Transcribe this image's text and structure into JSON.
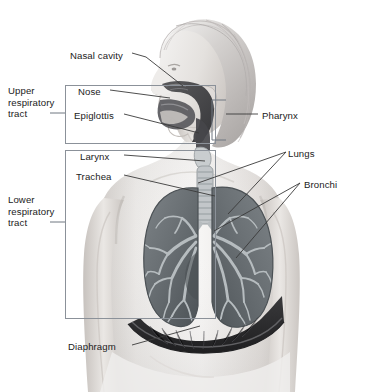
{
  "figure": {
    "view": "anterior torso with right lateral head profile, cutaway lungs",
    "style": "grayscale medical illustration"
  },
  "colors": {
    "background": "#ffffff",
    "label_text": "#1b1b1b",
    "leader_line": "#3a3a3a",
    "bracket_line": "#6f7680",
    "skin_light": "#f2f0ee",
    "skin_mid": "#ddd9d6",
    "skin_shadow": "#bfbab6",
    "hair_light": "#e8e6e4",
    "hair_mid": "#c9c6c4",
    "hair_dark": "#a9a5a3",
    "airway_dark": "#4a4a4c",
    "airway_darker": "#3a3a3c",
    "lung_fill": "#6e7478",
    "lung_fill_dark": "#575d61",
    "bronchi_tree": "#b9bfc2",
    "trachea_ring": "#c4c8ca",
    "diaphragm_dark": "#2b2b2d"
  },
  "group_labels": [
    {
      "id": "upper-respiratory-tract",
      "text": "Upper\nrespiratory\ntract",
      "x": 8,
      "y": 85,
      "tick": {
        "x1": 50,
        "y1": 113,
        "x2": 65,
        "y2": 113
      }
    },
    {
      "id": "lower-respiratory-tract",
      "text": "Lower\nrespiratory\ntract",
      "x": 8,
      "y": 194,
      "tick": {
        "x1": 50,
        "y1": 222,
        "x2": 65,
        "y2": 222
      }
    }
  ],
  "boxes": [
    {
      "id": "upper-tract-box",
      "x": 65,
      "y": 85,
      "w": 150,
      "h": 58
    },
    {
      "id": "lower-tract-box",
      "x": 65,
      "y": 150,
      "w": 150,
      "h": 168
    }
  ],
  "part_labels": [
    {
      "id": "nasal-cavity",
      "text": "Nasal cavity",
      "x": 70,
      "y": 56,
      "anchor": "start"
    },
    {
      "id": "nose",
      "text": "Nose",
      "x": 78,
      "y": 93,
      "anchor": "start"
    },
    {
      "id": "epiglottis",
      "text": "Epiglottis",
      "x": 74,
      "y": 117,
      "anchor": "start"
    },
    {
      "id": "pharynx",
      "text": "Pharynx",
      "x": 262,
      "y": 117,
      "anchor": "start"
    },
    {
      "id": "larynx",
      "text": "Larynx",
      "x": 80,
      "y": 158,
      "anchor": "start"
    },
    {
      "id": "trachea",
      "text": "Trachea",
      "x": 76,
      "y": 178,
      "anchor": "start"
    },
    {
      "id": "lungs",
      "text": "Lungs",
      "x": 288,
      "y": 155,
      "anchor": "start"
    },
    {
      "id": "bronchi",
      "text": "Bronchi",
      "x": 304,
      "y": 186,
      "anchor": "start"
    },
    {
      "id": "diaphragm",
      "text": "Diaphragm",
      "x": 68,
      "y": 348,
      "anchor": "start"
    }
  ],
  "leader_lines": [
    {
      "for": "nasal-cavity",
      "points": "132,53 146,57 183,86"
    },
    {
      "for": "nose",
      "points": "110,90 170,98"
    },
    {
      "for": "epiglottis",
      "points": "124,114 199,133"
    },
    {
      "for": "pharynx",
      "points": "258,114 226,114"
    },
    {
      "for": "larynx",
      "points": "124,155 205,161"
    },
    {
      "for": "trachea",
      "points": "124,175 215,196"
    },
    {
      "for": "lungs-a",
      "points": "286,152 198,183"
    },
    {
      "for": "lungs-b",
      "points": "286,152 228,214"
    },
    {
      "for": "bronchi-a",
      "points": "300,183 214,231"
    },
    {
      "for": "bronchi-b",
      "points": "300,183 236,258"
    },
    {
      "for": "diaphragm",
      "points": "132,345 200,326"
    }
  ],
  "brackets": [
    {
      "id": "pharynx-bracket",
      "x": 212,
      "y": 100,
      "w": 14,
      "h": 40,
      "open_side": "right"
    }
  ],
  "anatomy_parts": [
    {
      "name": "hair"
    },
    {
      "name": "head-profile"
    },
    {
      "name": "nasal-cavity-passage"
    },
    {
      "name": "nose"
    },
    {
      "name": "oral-cavity"
    },
    {
      "name": "epiglottis"
    },
    {
      "name": "pharynx-region"
    },
    {
      "name": "larynx"
    },
    {
      "name": "trachea"
    },
    {
      "name": "left-lung"
    },
    {
      "name": "right-lung"
    },
    {
      "name": "bronchial-tree"
    },
    {
      "name": "diaphragm"
    },
    {
      "name": "torso"
    },
    {
      "name": "arms"
    }
  ]
}
